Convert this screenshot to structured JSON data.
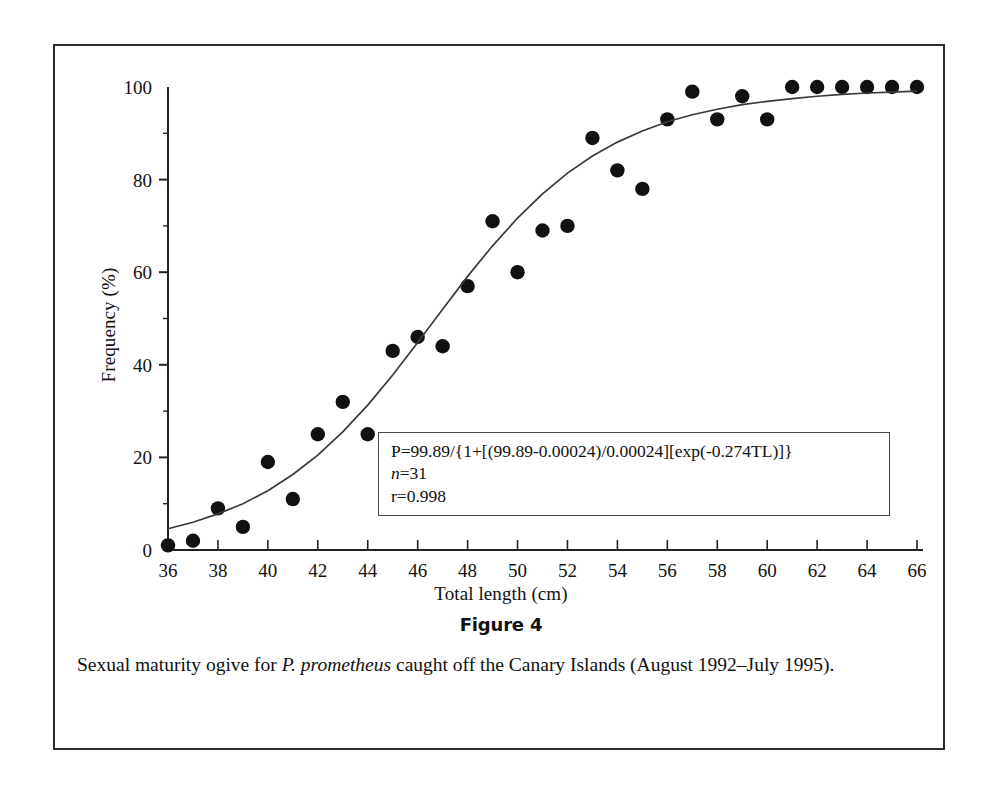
{
  "figure": {
    "heading": "Figure 4",
    "caption_prefix": "Sexual maturity ogive for ",
    "caption_species": "P. prometheus",
    "caption_suffix": " caught off the Canary Islands (August 1992–July 1995)."
  },
  "annotation": {
    "equation": "P=99.89/{1+[(99.89-0.00024)/0.00024][exp(-0.274TL)]}",
    "n_symbol": "n",
    "n_value": "=31",
    "r_value": "r=0.998"
  },
  "chart_data": {
    "type": "scatter",
    "title": "",
    "xlabel": "Total length (cm)",
    "ylabel": "Frequency (%)",
    "xlim": [
      36,
      66
    ],
    "ylim": [
      0,
      100
    ],
    "xticks": [
      36,
      38,
      40,
      42,
      44,
      46,
      48,
      50,
      52,
      54,
      56,
      58,
      60,
      62,
      64,
      66
    ],
    "xtick_labels": [
      "36",
      "38",
      "40",
      "42",
      "44",
      "46",
      "48",
      "50",
      "52",
      "54",
      "56",
      "58",
      "60",
      "62",
      "64",
      "66"
    ],
    "xminorticks": [
      37,
      39,
      41,
      43,
      45,
      47,
      49,
      51,
      53,
      55,
      57,
      59,
      61,
      63,
      65
    ],
    "yticks": [
      0,
      20,
      40,
      60,
      80,
      100
    ],
    "ytick_labels": [
      "0",
      "20",
      "40",
      "60",
      "80",
      "100"
    ],
    "yminorticks": [
      10,
      30,
      50,
      70,
      90
    ],
    "grid": false,
    "legend": false,
    "marker_color": "#111111",
    "line_color": "#3a3a3a",
    "series": [
      {
        "name": "Observed maturity",
        "type": "scatter",
        "x": [
          36,
          37,
          38,
          39,
          40,
          41,
          42,
          43,
          44,
          45,
          46,
          47,
          48,
          49,
          50,
          51,
          52,
          53,
          54,
          55,
          56,
          57,
          58,
          59,
          60,
          61,
          62,
          63,
          64,
          65,
          66
        ],
        "y": [
          1,
          2,
          9,
          5,
          19,
          11,
          25,
          32,
          25,
          43,
          46,
          44,
          57,
          71,
          60,
          69,
          70,
          89,
          82,
          78,
          93,
          99,
          93,
          98,
          93,
          100,
          100,
          100,
          100,
          100,
          100
        ]
      },
      {
        "name": "Fitted logistic ogive",
        "type": "line",
        "equation_params": {
          "P_max": 99.89,
          "a": 0.00024,
          "k": 0.274
        },
        "x": [
          36,
          37,
          38,
          39,
          40,
          41,
          42,
          43,
          44,
          45,
          46,
          47,
          48,
          49,
          50,
          51,
          52,
          53,
          54,
          55,
          56,
          57,
          58,
          59,
          60,
          61,
          62,
          63,
          64,
          65,
          66
        ],
        "y": [
          4.6,
          6.0,
          7.8,
          10.0,
          12.8,
          16.3,
          20.5,
          25.5,
          31.3,
          37.8,
          44.8,
          52.0,
          59.1,
          65.7,
          71.7,
          76.9,
          81.4,
          85.1,
          88.1,
          90.5,
          92.5,
          94.0,
          95.2,
          96.2,
          96.9,
          97.5,
          98.0,
          98.4,
          98.7,
          98.9,
          99.1
        ]
      }
    ]
  }
}
